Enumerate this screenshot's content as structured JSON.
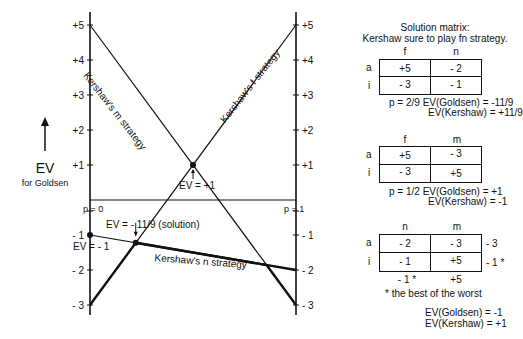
{
  "chart_data": {
    "type": "line",
    "ylabel": "EV for Goldsen",
    "xlabel": "p",
    "x_ticks": [
      "p = 0",
      "p = 1"
    ],
    "ylim": [
      -3,
      5
    ],
    "y_ticks_left": [
      "+5",
      "+4",
      "+3",
      "+2",
      "+1",
      "- 1",
      "- 2",
      "- 3"
    ],
    "y_ticks_right": [
      "+5",
      "+4",
      "+3",
      "+2",
      "+1",
      "- 1",
      "- 2",
      "- 3"
    ],
    "series": [
      {
        "name": "Kershaw's m strategy",
        "x": [
          0,
          1
        ],
        "values": [
          5,
          -3
        ]
      },
      {
        "name": "Kershaw's f strategy",
        "x": [
          0,
          1
        ],
        "values": [
          -3,
          5
        ]
      },
      {
        "name": "Kershaw's n strategy",
        "x": [
          0,
          1
        ],
        "values": [
          -1,
          -2
        ]
      }
    ],
    "annotations": [
      {
        "text": "EV = +1",
        "x": 0.5,
        "y": 1
      },
      {
        "text": "EV = - 11/9 (solution)",
        "x": 0.2222,
        "y": -1.2222
      },
      {
        "text": "EV = - 1",
        "x": 0,
        "y": -1
      }
    ],
    "grid": false
  },
  "axis": {
    "ev_label": "EV",
    "ev_sub": "for Goldsen",
    "p0": "p = 0",
    "p1": "p = 1",
    "ticks": [
      {
        "v": 5,
        "label": "+5"
      },
      {
        "v": 4,
        "label": "+4"
      },
      {
        "v": 3,
        "label": "+3"
      },
      {
        "v": 2,
        "label": "+2"
      },
      {
        "v": 1,
        "label": "+1"
      },
      {
        "v": -1,
        "label": "- 1"
      },
      {
        "v": -2,
        "label": "- 2"
      },
      {
        "v": -3,
        "label": "- 3"
      }
    ]
  },
  "labels": {
    "m_strategy": "Kershaw's m strategy",
    "f_strategy": "Kershaw's f strategy",
    "n_strategy": "Kershaw's n strategy",
    "ev_plus1": "EV = +1",
    "ev_solution": "EV = - 11/9 (solution)",
    "ev_minus1": "EV = - 1"
  },
  "matrix1": {
    "title1": "Solution matrix:",
    "title2": "Kershaw sure to play fn strategy.",
    "cols": [
      "f",
      "n"
    ],
    "rows": [
      "a",
      "i"
    ],
    "cells": [
      [
        "+5",
        "- 2"
      ],
      [
        "- 3",
        "- 1"
      ]
    ],
    "note1": "p = 2/9  EV(Goldsen) = -11/9",
    "note2": "EV(Kershaw) = +11/9"
  },
  "matrix2": {
    "cols": [
      "f",
      "m"
    ],
    "rows": [
      "a",
      "i"
    ],
    "cells": [
      [
        "+5",
        "- 3"
      ],
      [
        "- 3",
        "+5"
      ]
    ],
    "note1": "p = 1/2  EV(Goldsen) = +1",
    "note2": "EV(Kershaw) = -1"
  },
  "matrix3": {
    "cols": [
      "n",
      "m"
    ],
    "rows": [
      "a",
      "i"
    ],
    "cells": [
      [
        "- 2",
        "- 3"
      ],
      [
        "- 1",
        "+5"
      ]
    ],
    "row_mins": [
      "- 3",
      "- 1 *"
    ],
    "col_maxs": [
      "- 1 *",
      "+5"
    ],
    "footnote": "* the best of the worst",
    "note1": "EV(Goldsen) = -1",
    "note2": "EV(Kershaw) = +1"
  }
}
